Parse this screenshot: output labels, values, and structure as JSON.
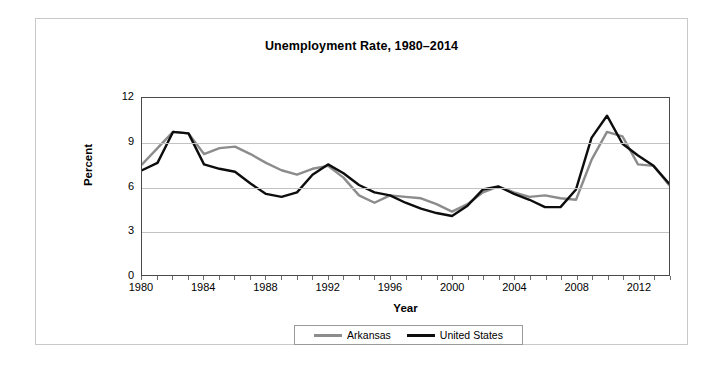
{
  "figure": {
    "title": "Unemployment Rate, 1980–2014"
  },
  "axes": {
    "y_title": "Percent",
    "x_title": "Year",
    "y_ticks": [
      "12",
      "9",
      "6",
      "3",
      "0"
    ],
    "x_ticks": [
      "1980",
      "1984",
      "1988",
      "1992",
      "1996",
      "2000",
      "2004",
      "2008",
      "2012"
    ]
  },
  "legend": {
    "entries": [
      {
        "label": "Arkansas",
        "color": "#8c8c8c"
      },
      {
        "label": "United States",
        "color": "#0d0d0d"
      }
    ]
  },
  "chart_data": {
    "type": "line",
    "title": "Unemployment Rate, 1980–2014",
    "xlabel": "Year",
    "ylabel": "Percent",
    "xlim": [
      1980,
      2014
    ],
    "ylim": [
      0,
      12
    ],
    "ytick_interval": 3,
    "xtick_interval": 4,
    "grid": "horizontal",
    "legend_position": "bottom-center",
    "x": [
      1980,
      1981,
      1982,
      1983,
      1984,
      1985,
      1986,
      1987,
      1988,
      1989,
      1990,
      1991,
      1992,
      1993,
      1994,
      1995,
      1996,
      1997,
      1998,
      1999,
      2000,
      2001,
      2002,
      2003,
      2004,
      2005,
      2006,
      2007,
      2008,
      2009,
      2010,
      2011,
      2012,
      2013,
      2014
    ],
    "series": [
      {
        "name": "Arkansas",
        "color": "#8c8c8c",
        "values": [
          7.5,
          8.6,
          9.7,
          9.6,
          8.2,
          8.6,
          8.7,
          8.2,
          7.6,
          7.1,
          6.8,
          7.2,
          7.4,
          6.6,
          5.4,
          4.9,
          5.4,
          5.3,
          5.2,
          4.8,
          4.3,
          4.8,
          5.6,
          6.0,
          5.6,
          5.3,
          5.4,
          5.2,
          5.1,
          7.8,
          9.7,
          9.4,
          7.5,
          7.4,
          6.1
        ]
      },
      {
        "name": "United States",
        "color": "#0d0d0d",
        "values": [
          7.1,
          7.6,
          9.7,
          9.6,
          7.5,
          7.2,
          7.0,
          6.2,
          5.5,
          5.3,
          5.6,
          6.8,
          7.5,
          6.9,
          6.1,
          5.6,
          5.4,
          4.9,
          4.5,
          4.2,
          4.0,
          4.7,
          5.8,
          6.0,
          5.5,
          5.1,
          4.6,
          4.6,
          5.8,
          9.3,
          10.8,
          8.9,
          8.1,
          7.4,
          6.2
        ]
      }
    ]
  }
}
